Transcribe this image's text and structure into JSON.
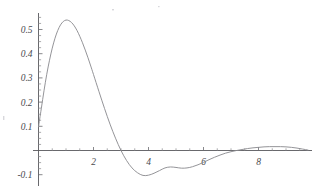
{
  "chart_data": {
    "type": "line",
    "title": "",
    "subtitle": "",
    "xlabel": "",
    "ylabel": "",
    "xlim": [
      -0.15,
      9.9
    ],
    "ylim": [
      -0.13,
      0.59
    ],
    "grid": false,
    "legend": null,
    "legend_position": "none",
    "axis_color": "#58585c",
    "curve_color": "#8e8e92",
    "background_color": "#ffffff",
    "x_ticks_major": [
      2,
      4,
      6,
      8
    ],
    "x_tick_labels": [
      "2",
      "4",
      "6",
      "8"
    ],
    "x_ticks_minor": [
      0.5,
      1,
      1.5,
      2.5,
      3,
      3.5,
      4.5,
      5,
      5.5,
      6.5,
      7,
      7.5,
      8.5,
      9,
      9.5
    ],
    "y_ticks_major": [
      -0.1,
      0.1,
      0.2,
      0.3,
      0.4,
      0.5
    ],
    "y_tick_labels": [
      "-0.1",
      "0.1",
      "0.2",
      "0.3",
      "0.4",
      "0.5"
    ],
    "y_ticks_minor": [
      -0.075,
      -0.05,
      -0.025,
      0.025,
      0.05,
      0.075,
      0.125,
      0.15,
      0.175,
      0.225,
      0.25,
      0.275,
      0.325,
      0.35,
      0.375,
      0.425,
      0.45,
      0.475,
      0.525,
      0.55
    ],
    "annotations": [],
    "series": [
      {
        "name": "damped oscillation",
        "x": [
          0.0,
          0.1,
          0.2,
          0.3,
          0.4,
          0.5,
          0.6,
          0.7,
          0.8,
          0.9,
          1.0,
          1.1,
          1.2,
          1.3,
          1.4,
          1.5,
          1.6,
          1.7,
          1.8,
          1.9,
          2.0,
          2.2,
          2.4,
          2.6,
          2.8,
          3.0,
          3.2,
          3.4,
          3.6,
          3.8,
          4.0,
          4.2,
          4.4,
          4.6,
          4.8,
          5.0,
          5.2,
          5.4,
          5.6,
          5.8,
          6.0,
          6.2,
          6.4,
          6.6,
          6.8,
          7.0,
          7.2,
          7.4,
          7.6,
          7.8,
          8.0,
          8.2,
          8.4,
          8.6,
          8.8,
          9.0,
          9.2,
          9.4,
          9.6,
          9.8
        ],
        "y": [
          0.098,
          0.172,
          0.247,
          0.315,
          0.373,
          0.423,
          0.464,
          0.496,
          0.519,
          0.533,
          0.539,
          0.537,
          0.529,
          0.515,
          0.496,
          0.472,
          0.445,
          0.415,
          0.383,
          0.349,
          0.314,
          0.243,
          0.174,
          0.109,
          0.051,
          0.0,
          -0.041,
          -0.072,
          -0.092,
          -0.103,
          -0.102,
          -0.094,
          -0.083,
          -0.072,
          -0.068,
          -0.07,
          -0.073,
          -0.072,
          -0.067,
          -0.059,
          -0.049,
          -0.038,
          -0.028,
          -0.019,
          -0.011,
          -0.005,
          0.0,
          0.004,
          0.008,
          0.011,
          0.013,
          0.015,
          0.016,
          0.016,
          0.016,
          0.015,
          0.013,
          0.01,
          0.006,
          0.002
        ]
      }
    ],
    "features": {
      "peak": {
        "x": 1.35,
        "y": 0.537
      },
      "first_zero_crossing": {
        "x": 3.5,
        "y": 0.0
      },
      "minimum": {
        "x": 4.85,
        "y": -0.085
      },
      "second_zero_crossing": {
        "x": 7.25,
        "y": 0.0
      },
      "secondary_bump_peak": {
        "x": 8.5,
        "y": 0.016
      }
    }
  }
}
